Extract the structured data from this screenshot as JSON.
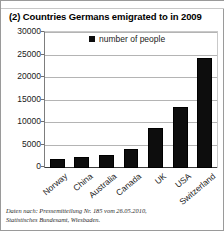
{
  "figure": {
    "partial_text_above": "",
    "border_color": "#9a9a9a"
  },
  "source_note": {
    "line1": "Daten nach: Pressemitteilung Nr. 185 vom 26.05.2010,",
    "line2": "Statistisches Bundesamt, Wiesbaden."
  },
  "chart_data": {
    "type": "bar",
    "title": "(2) Countries Germans emigrated to in 2009",
    "xlabel": "",
    "ylabel": "",
    "categories": [
      "Norway",
      "China",
      "Australia",
      "Canada",
      "UK",
      "USA",
      "Switzerland"
    ],
    "values": [
      2000,
      2500,
      3000,
      4200,
      9000,
      13500,
      24500
    ],
    "series": [
      {
        "name": "number of people",
        "values": [
          2000,
          2500,
          3000,
          4200,
          9000,
          13500,
          24500
        ]
      }
    ],
    "ylim": [
      0,
      30000
    ],
    "ytick_labels": [
      "30000",
      "25000",
      "20000",
      "15000",
      "10000",
      "5000",
      "0"
    ],
    "ytick_values": [
      30000,
      25000,
      20000,
      15000,
      10000,
      5000,
      0
    ],
    "grid": true,
    "legend": {
      "position": "top-center",
      "entries": [
        "number of people"
      ]
    },
    "bar_color": "#0d0d0d"
  }
}
